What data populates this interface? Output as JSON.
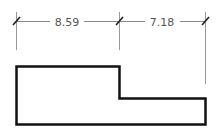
{
  "diagram": {
    "dimensions": [
      {
        "label": "8.59",
        "from_x": 16,
        "to_x": 119
      },
      {
        "label": "7.18",
        "from_x": 119,
        "to_x": 205
      }
    ],
    "colors": {
      "dimension_line": "#888888",
      "tick": "#222222",
      "outline": "#111111",
      "text": "#555555"
    }
  }
}
